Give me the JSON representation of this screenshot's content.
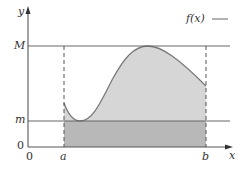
{
  "figure": {
    "type": "diagram",
    "legend": {
      "label": "f(x)",
      "line_symbol": "—"
    },
    "axes": {
      "x_label": "x",
      "y_label": "y",
      "x_origin_label": "0",
      "y_origin_label": "0"
    },
    "levels": {
      "upper_label": "M",
      "lower_label": "m"
    },
    "interval": {
      "left_label": "a",
      "right_label": "b"
    },
    "colors": {
      "axis": "#555555",
      "curve": "#7a7a7a",
      "fill_above_m": "#d6d6d6",
      "fill_below_m": "#b8b8b8",
      "guide_lines": "#666666",
      "dashed_bounds": "#555555"
    },
    "caption": {
      "visible_text": ""
    }
  }
}
